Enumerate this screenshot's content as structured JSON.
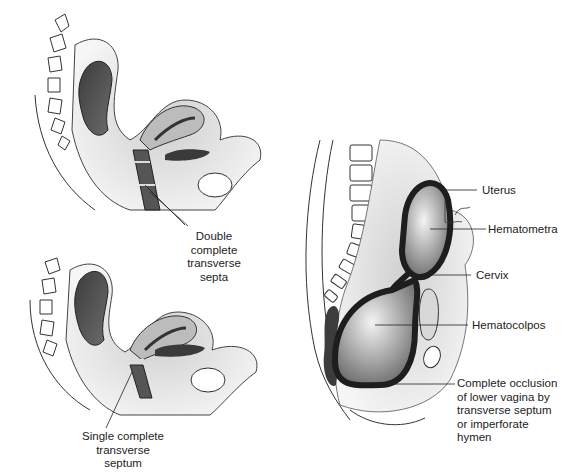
{
  "panels": {
    "top_left": {
      "name": "double-septa-sagittal",
      "label": [
        "Double",
        "complete",
        "transverse",
        "septa"
      ]
    },
    "bottom_left": {
      "name": "single-septum-sagittal",
      "label": [
        "Single complete",
        "transverse",
        "septum"
      ]
    },
    "right": {
      "name": "hematocolpos-sagittal",
      "labels": {
        "uterus": "Uterus",
        "hematometra": "Hematometra",
        "cervix": "Cervix",
        "hematocolpos": "Hematocolpos",
        "occlusion": [
          "Complete occlusion",
          "of lower vagina by",
          "transverse septum",
          "or imperforate",
          "hymen"
        ]
      }
    }
  },
  "colors": {
    "line": "#2a2a2a",
    "tissue_light": "#e6e6e6",
    "tissue_mid": "#bdbdbd",
    "rectum_dark": "#4a4a4a",
    "outline_dark": "#1e1e1e"
  }
}
